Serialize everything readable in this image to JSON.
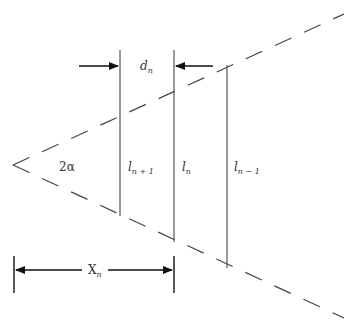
{
  "diagram": {
    "title": "",
    "labels": {
      "angle": "2α",
      "gap": {
        "main": "d",
        "sub": "n"
      },
      "line_next": {
        "main": "l",
        "sub": "n + 1"
      },
      "line_current": {
        "main": "l",
        "sub": "n"
      },
      "line_prev": {
        "main": "l",
        "sub": "n − 1"
      },
      "distance": {
        "main": "X",
        "sub": "n"
      }
    },
    "colors": {
      "line": "#444444",
      "arrow": "#111111",
      "text": "#333333"
    }
  }
}
